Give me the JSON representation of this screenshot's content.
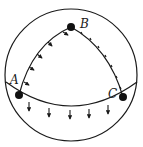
{
  "diagram": {
    "type": "spherical-triangle",
    "colors": {
      "stroke": "#1a1a1a",
      "background": "#ffffff",
      "vertex": "#111111"
    },
    "sphere": {
      "cx": 71,
      "cy": 75,
      "r": 66
    },
    "vertices": [
      {
        "id": "A",
        "label": "A",
        "x": 19,
        "y": 95,
        "label_x": 10,
        "label_y": 84
      },
      {
        "id": "B",
        "label": "B",
        "x": 71,
        "y": 27,
        "label_x": 80,
        "label_y": 28
      },
      {
        "id": "C",
        "label": "C",
        "x": 123,
        "y": 97,
        "label_x": 108,
        "label_y": 98
      }
    ],
    "edges": [
      {
        "from": "A",
        "to": "B",
        "marking": "inward-arrows",
        "arrow_count": 5
      },
      {
        "from": "B",
        "to": "C",
        "marking": "ticks",
        "tick_count": 7
      },
      {
        "from": "A",
        "to": "C",
        "marking": "downward-arrows",
        "arrow_count": 5
      }
    ]
  }
}
